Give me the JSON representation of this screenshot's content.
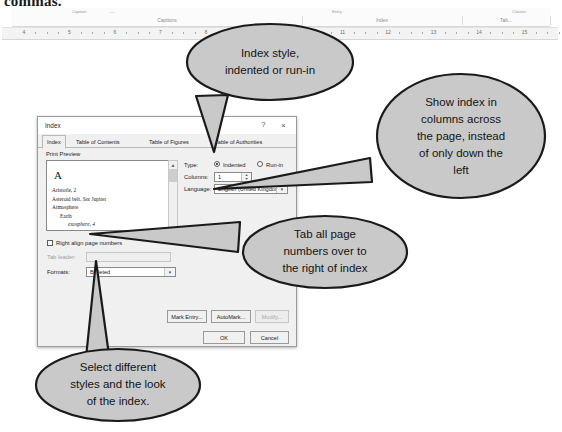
{
  "page": {
    "cut_heading": "commas."
  },
  "ribbon": {
    "mini_labels": [
      {
        "text": "Caption",
        "x": 60,
        "y": 1
      },
      {
        "text": "—",
        "x": 98,
        "y": 1
      },
      {
        "text": "Entry",
        "x": 320,
        "y": 1
      },
      {
        "text": "Citation",
        "x": 500,
        "y": 1
      }
    ],
    "groups": [
      {
        "label": "Captions",
        "left": 20,
        "width": 270
      },
      {
        "label": "Index",
        "left": 290,
        "width": 160
      },
      {
        "label": "Tab...",
        "left": 450,
        "width": 88
      }
    ]
  },
  "ruler": {
    "numbers": [
      4,
      5,
      6,
      7,
      8,
      9,
      10,
      11,
      12,
      13,
      14,
      15
    ],
    "first_x": 22,
    "spacing": 45.5
  },
  "dialog": {
    "title": "Index",
    "help_icon": "?",
    "close_icon": "×",
    "tabs": [
      {
        "label": "Index",
        "active": true,
        "left": 4,
        "accel": "I"
      },
      {
        "label": "Table of Contents",
        "active": false,
        "left": 33,
        "accel": ""
      },
      {
        "label": "Table of Figures",
        "active": false,
        "left": 106,
        "accel": ""
      },
      {
        "label": "Table of Authorities",
        "active": false,
        "left": 172,
        "accel": ""
      }
    ],
    "print_preview": {
      "label": "Print Preᴠiew",
      "letter": "A",
      "lines": [
        {
          "text": "Aristotle, 2",
          "indent": 0,
          "italic": false
        },
        {
          "text": "Asteroid belt. See Jupiter",
          "indent": 0,
          "italic": false
        },
        {
          "text": "Atmosphere",
          "indent": 0,
          "italic": false
        },
        {
          "text": "Earth",
          "indent": 8,
          "italic": false
        },
        {
          "text": "exosphere, 4",
          "indent": 16,
          "italic": true
        }
      ]
    },
    "type": {
      "label": "Type:",
      "options": [
        {
          "label": "Indented",
          "selected": true
        },
        {
          "label": "Run-in",
          "selected": false
        }
      ]
    },
    "columns": {
      "label": "Columns:",
      "value": "1"
    },
    "language": {
      "label": "Language:",
      "value": "English (United Kingdom)"
    },
    "right_align": {
      "label": "Right align page numbers",
      "checked": false
    },
    "tab_leader": {
      "label": "Tab leader:",
      "value": "",
      "enabled": false
    },
    "formats": {
      "label": "Formats:",
      "value": "Bulleted"
    },
    "buttons": [
      {
        "name": "mark-entry",
        "label": "Mark Entry...",
        "enabled": true
      },
      {
        "name": "automark",
        "label": "AutoMark...",
        "enabled": true
      },
      {
        "name": "modify",
        "label": "Modify...",
        "enabled": false
      },
      {
        "name": "ok",
        "label": "OK",
        "enabled": true
      },
      {
        "name": "cancel",
        "label": "Cancel",
        "enabled": true
      }
    ]
  },
  "callouts": [
    {
      "name": "index-style",
      "lines": [
        "Index style,",
        "indented or run-in"
      ]
    },
    {
      "name": "columns-across",
      "lines": [
        "Show index in",
        "columns across",
        "the page, instead",
        "of only down the",
        "left"
      ]
    },
    {
      "name": "tab-page-numbers",
      "lines": [
        "Tab all page",
        "numbers over to",
        "the right of index"
      ]
    },
    {
      "name": "select-styles",
      "lines": [
        "Select different",
        "styles and the look",
        "of the index."
      ]
    }
  ],
  "colors": {
    "callout_fill": "#c9c9c9",
    "callout_stroke": "#1a1a1a",
    "dialog_bg": "#f0f0f0",
    "text": "#141414"
  }
}
